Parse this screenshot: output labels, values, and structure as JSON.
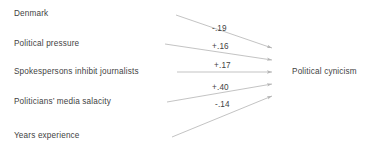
{
  "diagram": {
    "type": "path-diagram",
    "background_color": "#ffffff",
    "text_color": "#3f3f3f",
    "arrow_color": "#b4b4b4",
    "outcome": {
      "label": "Political cynicism",
      "x": 292,
      "y": 72
    },
    "predictors": [
      {
        "id": "denmark",
        "label": "Denmark",
        "x": 14,
        "y": 14,
        "coefficient": "-.19",
        "coef_value": -0.19,
        "coef_x": 212,
        "coef_y": 29,
        "line_start_x": 176,
        "line_start_y": 15,
        "line_end_x": 272,
        "line_end_y": 48
      },
      {
        "id": "political-pressure",
        "label": "Political pressure",
        "x": 14,
        "y": 44,
        "coefficient": "+.16",
        "coef_value": 0.16,
        "coef_x": 212,
        "coef_y": 47,
        "line_start_x": 165,
        "line_start_y": 44,
        "line_end_x": 272,
        "line_end_y": 60
      },
      {
        "id": "spokespersons",
        "label": "Spokespersons inhibit journalists",
        "x": 14,
        "y": 72,
        "coefficient": "+.17",
        "coef_value": 0.17,
        "coef_x": 214,
        "coef_y": 66,
        "line_start_x": 177,
        "line_start_y": 72,
        "line_end_x": 272,
        "line_end_y": 72
      },
      {
        "id": "media-salacity",
        "label": "Politicians’ media salacity",
        "x": 14,
        "y": 102,
        "coefficient": "+.40",
        "coef_value": 0.4,
        "coef_x": 212,
        "coef_y": 88,
        "line_start_x": 167,
        "line_start_y": 102,
        "line_end_x": 272,
        "line_end_y": 84
      },
      {
        "id": "years-experience",
        "label": "Years experience",
        "x": 14,
        "y": 136,
        "coefficient": "-.14",
        "coef_value": -0.14,
        "coef_x": 215,
        "coef_y": 105,
        "line_start_x": 172,
        "line_start_y": 137,
        "line_end_x": 272,
        "line_end_y": 96
      }
    ]
  }
}
